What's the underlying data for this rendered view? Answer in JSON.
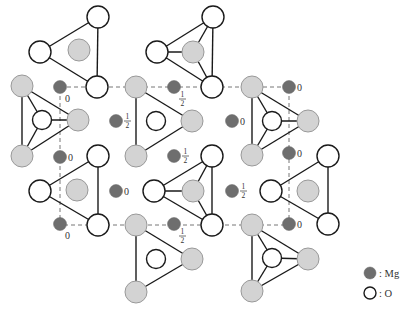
{
  "figure": {
    "colors": {
      "mg": "#6e6e6e",
      "o_fill": "#ffffff",
      "o_stroke": "#1a1a1a",
      "gray_atom": "#d3d3d3"
    }
  },
  "unit_cell": {
    "x1": 60,
    "y1": 87,
    "x2": 289,
    "y2": 225
  },
  "triangles": [
    {
      "verts": [
        [
          98,
          17
        ],
        [
          40,
          52
        ],
        [
          97,
          87
        ]
      ],
      "center": [
        79,
        50
      ],
      "center_type": "gray",
      "vert_type": "o",
      "radial": false
    },
    {
      "verts": [
        [
          213,
          17
        ],
        [
          157,
          52
        ],
        [
          212,
          87
        ]
      ],
      "center": [
        193,
        52
      ],
      "center_type": "gray",
      "vert_type": "o",
      "radial": true
    },
    {
      "verts": [
        [
          22,
          86
        ],
        [
          78,
          120
        ],
        [
          22,
          156
        ]
      ],
      "center": [
        42,
        120
      ],
      "center_type": "o",
      "vert_type": "gray",
      "radial": true
    },
    {
      "verts": [
        [
          136,
          87
        ],
        [
          192,
          121
        ],
        [
          136,
          156
        ]
      ],
      "center": [
        156,
        121
      ],
      "center_type": "o",
      "vert_type": "gray",
      "radial": false
    },
    {
      "verts": [
        [
          252,
          87
        ],
        [
          308,
          121
        ],
        [
          252,
          155
        ]
      ],
      "center": [
        272,
        121
      ],
      "center_type": "o",
      "vert_type": "gray",
      "radial": true
    },
    {
      "verts": [
        [
          98,
          156
        ],
        [
          40,
          191
        ],
        [
          98,
          225
        ]
      ],
      "center": [
        77,
        190
      ],
      "center_type": "gray",
      "vert_type": "o",
      "radial": false
    },
    {
      "verts": [
        [
          212,
          156
        ],
        [
          154,
          191
        ],
        [
          212,
          225
        ]
      ],
      "center": [
        193,
        191
      ],
      "center_type": "gray",
      "vert_type": "o",
      "radial": true
    },
    {
      "verts": [
        [
          328,
          156
        ],
        [
          271,
          191
        ],
        [
          328,
          224
        ]
      ],
      "center": [
        308,
        191
      ],
      "center_type": "gray",
      "vert_type": "o",
      "radial": false
    },
    {
      "verts": [
        [
          136,
          225
        ],
        [
          192,
          259
        ],
        [
          136,
          292
        ]
      ],
      "center": [
        156,
        259
      ],
      "center_type": "o",
      "vert_type": "gray",
      "radial": false
    },
    {
      "verts": [
        [
          252,
          225
        ],
        [
          308,
          259
        ],
        [
          252,
          291
        ]
      ],
      "center": [
        272,
        258
      ],
      "center_type": "o",
      "vert_type": "gray",
      "radial": true
    }
  ],
  "mg_atoms": [
    {
      "x": 60,
      "y": 87,
      "label": "0",
      "pos": "below"
    },
    {
      "x": 174,
      "y": 87,
      "label": "1/2",
      "pos": "below"
    },
    {
      "x": 289,
      "y": 87,
      "label": "0",
      "pos": "right"
    },
    {
      "x": 116,
      "y": 121,
      "label": "1/2",
      "pos": "right"
    },
    {
      "x": 232,
      "y": 121,
      "label": "0",
      "pos": "right"
    },
    {
      "x": 60,
      "y": 157,
      "label": "0",
      "pos": "right"
    },
    {
      "x": 174,
      "y": 156,
      "label": "1/2",
      "pos": "right"
    },
    {
      "x": 289,
      "y": 153,
      "label": "0",
      "pos": "right"
    },
    {
      "x": 116,
      "y": 191,
      "label": "0",
      "pos": "right"
    },
    {
      "x": 232,
      "y": 191,
      "label": "1/2",
      "pos": "right"
    },
    {
      "x": 60,
      "y": 224,
      "label": "0",
      "pos": "below"
    },
    {
      "x": 174,
      "y": 224,
      "label": "1/2",
      "pos": "below"
    },
    {
      "x": 289,
      "y": 224,
      "label": "0",
      "pos": "right"
    }
  ],
  "legend": {
    "items": [
      {
        "symbol": "mg",
        "label": ": Mg"
      },
      {
        "symbol": "o",
        "label": ": O"
      }
    ]
  }
}
